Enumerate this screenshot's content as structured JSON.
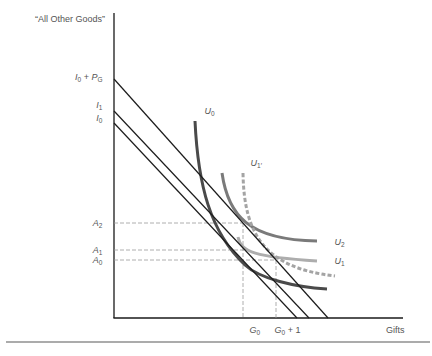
{
  "axes": {
    "y_label": "“All Other Goods”",
    "x_label": "Gifts"
  },
  "labels": {
    "i0_pg": {
      "a": "I",
      "a_sub": "0",
      "plus": " + ",
      "b": "P",
      "b_sub": "G"
    },
    "i1": {
      "main": "I",
      "sub": "1"
    },
    "i0": {
      "main": "I",
      "sub": "0"
    },
    "a2": {
      "main": "A",
      "sub": "2"
    },
    "a1": {
      "main": "A",
      "sub": "1"
    },
    "a0": {
      "main": "A",
      "sub": "0"
    },
    "g0": {
      "main": "G",
      "sub": "0"
    },
    "g0_plus_1": {
      "main": "G",
      "sub": "0",
      "suffix": " + 1"
    },
    "u0": {
      "main": "U",
      "sub": "0"
    },
    "u1_prime": {
      "main": "U",
      "sub": "1′"
    },
    "u2": {
      "main": "U",
      "sub": "2"
    },
    "u1": {
      "main": "U",
      "sub": "1"
    }
  },
  "colors": {
    "axis": "#1a1a1a",
    "budget_line": "#1c1c1c",
    "guide_dashed": "#9a9a9a",
    "u0": "#4a4a4a",
    "u2": "#7a7a7a",
    "u1": "#adadad",
    "u1_prime": "#a4a4a4",
    "label_text": "#555555",
    "bottom_rule": "#8f8f8f"
  },
  "geometry": {
    "y_axis": "M114,13 L114,318",
    "x_axis": "M113.4,318 L403,318",
    "budget_i0": "M114,123 L297,318",
    "budget_i1": "M114,111 L309,318",
    "budget_i0_pg": "M114,79 L328,318",
    "guide_a2": "M114,223 L243,223",
    "guide_a1": "M114,250 L244,250",
    "guide_a0": "M114,260 L276,260",
    "guide_g0": "M243,223 L243,318",
    "guide_g0_plus_1": "M276,260 L276,318",
    "u0": "M195,121 C198,185 210,232 245,265 C260,279 295,287 327,289",
    "u2": "M222,173 C228,215 248,240 317,241",
    "u1": "M238,237 C241,252 255,257 317,261",
    "u1_prime": "M243,173 C244,235 265,268 335,276",
    "bottom_rule": "M6,342 L430,342"
  },
  "chart_data": {
    "type": "line",
    "title": "",
    "xlabel": "Gifts",
    "ylabel": "“All Other Goods”",
    "x_tick_labels": [
      "G0",
      "G0 + 1"
    ],
    "y_tick_labels": [
      "I0 + PG",
      "I1",
      "I0",
      "A2",
      "A1",
      "A0"
    ],
    "grid": false,
    "legend": "none (curves labeled inline)",
    "units": "approximate plot units, origin at axis intersection",
    "series": [
      {
        "name": "Budget line I0",
        "style": "solid black",
        "points": [
          [
            0,
            195
          ],
          [
            183,
            0
          ]
        ]
      },
      {
        "name": "Budget line I1",
        "style": "solid black",
        "points": [
          [
            0,
            207
          ],
          [
            195,
            0
          ]
        ]
      },
      {
        "name": "Budget line I0 + PG",
        "style": "solid black",
        "points": [
          [
            0,
            239
          ],
          [
            214,
            0
          ]
        ]
      },
      {
        "name": "U0",
        "style": "solid dark gray",
        "points": [
          [
            81,
            197
          ],
          [
            88,
            138
          ],
          [
            96,
            108
          ],
          [
            111,
            78
          ],
          [
            139,
            46
          ],
          [
            173,
            35
          ],
          [
            213,
            29
          ]
        ]
      },
      {
        "name": "U1",
        "style": "solid light gray",
        "points": [
          [
            124,
            81
          ],
          [
            129,
            70
          ],
          [
            144,
            65
          ],
          [
            176,
            59
          ],
          [
            203,
            57
          ]
        ]
      },
      {
        "name": "U2",
        "style": "solid medium gray",
        "points": [
          [
            108,
            145
          ],
          [
            119,
            108
          ],
          [
            129,
            95
          ],
          [
            136,
            91
          ],
          [
            166,
            84
          ],
          [
            203,
            77
          ]
        ]
      },
      {
        "name": "U1'",
        "style": "dashed gray",
        "points": [
          [
            129,
            145
          ],
          [
            131,
            105
          ],
          [
            143,
            86
          ],
          [
            166,
            56
          ],
          [
            183,
            46
          ],
          [
            221,
            42
          ]
        ]
      }
    ],
    "reference_lines": {
      "A2": 95,
      "A1": 68,
      "A0": 58,
      "G0": 129,
      "G0 + 1": 162
    },
    "y_intercepts": {
      "I0 + PG": 239,
      "I1": 207,
      "I0": 195
    }
  }
}
